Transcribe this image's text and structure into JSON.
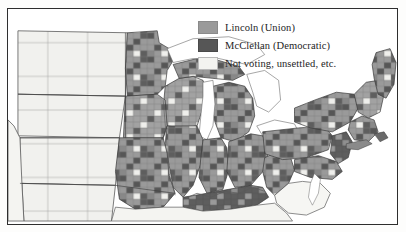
{
  "figure": {
    "kind": "historical-county-choropleth-map"
  },
  "legend": {
    "items": [
      {
        "label": "Lincoln (Union)",
        "swatch": "lincoln",
        "color": "#9a9a9a"
      },
      {
        "label": "McClellan (Democratic)",
        "swatch": "mcclellan",
        "color": "#565656"
      },
      {
        "label": "Not voting, unsettled, etc.",
        "swatch": "notvoting",
        "color": "#f3f3f0"
      }
    ]
  },
  "map": {
    "frame_color": "#2e2e2e",
    "water_color": "#ffffff",
    "county_line_color": "#7d7d7d",
    "state_line_color": "#3a3a3a",
    "regions": [
      {
        "name": "dakota-territory",
        "fill": "notvoting"
      },
      {
        "name": "nebraska-territory",
        "fill": "notvoting"
      },
      {
        "name": "kansas",
        "fill": "notvoting"
      },
      {
        "name": "minnesota",
        "fill": "mixed"
      },
      {
        "name": "wisconsin",
        "fill": "mixed"
      },
      {
        "name": "iowa",
        "fill": "mixed"
      },
      {
        "name": "missouri",
        "fill": "mixed"
      },
      {
        "name": "illinois",
        "fill": "mixed"
      },
      {
        "name": "michigan",
        "fill": "mixed"
      },
      {
        "name": "indiana",
        "fill": "mixed"
      },
      {
        "name": "ohio",
        "fill": "mixed"
      },
      {
        "name": "kentucky",
        "fill": "mcclellan"
      },
      {
        "name": "west-virginia",
        "fill": "mixed"
      },
      {
        "name": "pennsylvania",
        "fill": "mixed"
      },
      {
        "name": "new-york",
        "fill": "mixed"
      },
      {
        "name": "new-jersey",
        "fill": "mcclellan"
      },
      {
        "name": "new-england",
        "fill": "mixed"
      },
      {
        "name": "maine",
        "fill": "mixed"
      },
      {
        "name": "maryland-delaware",
        "fill": "mixed"
      },
      {
        "name": "confederate-south",
        "fill": "notvoting"
      },
      {
        "name": "lake-michigan",
        "fill": "water"
      },
      {
        "name": "lake-superior",
        "fill": "water"
      },
      {
        "name": "lake-huron",
        "fill": "water"
      },
      {
        "name": "lake-erie",
        "fill": "water"
      },
      {
        "name": "lake-ontario",
        "fill": "water"
      },
      {
        "name": "atlantic-ocean",
        "fill": "water"
      }
    ]
  }
}
